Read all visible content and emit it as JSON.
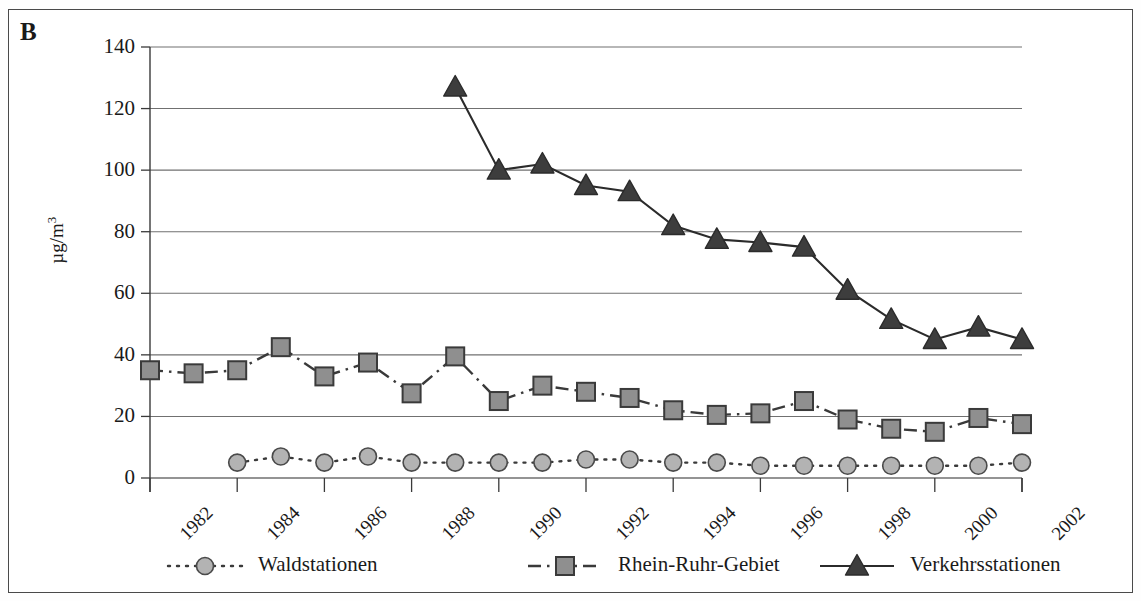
{
  "figure": {
    "panel_label": "B",
    "ylabel_main": "µg/m",
    "ylabel_exp": "3"
  },
  "legend": {
    "items": [
      {
        "label": "Waldstationen",
        "marker": "circle-marker",
        "line": "dotted",
        "fill": "#b3b3b3"
      },
      {
        "label": "Rhein-Ruhr-Gebiet",
        "marker": "square-marker",
        "line": "dash-dot",
        "fill": "#8f8f8f"
      },
      {
        "label": "Verkehrsstationen",
        "marker": "triangle-marker",
        "line": "solid",
        "fill": "#3d3d3d"
      }
    ]
  },
  "axes": {
    "y_ticks": [
      "0",
      "20",
      "40",
      "60",
      "80",
      "100",
      "120",
      "140"
    ],
    "x_ticks": [
      "1982",
      "1984",
      "1986",
      "1988",
      "1990",
      "1992",
      "1994",
      "1996",
      "1998",
      "2000",
      "2002"
    ]
  },
  "chart_data": {
    "type": "line",
    "title": "",
    "xlabel": "",
    "ylabel": "µg/m3",
    "xlim": [
      1982,
      2002
    ],
    "ylim": [
      0,
      140
    ],
    "ytick_interval": 20,
    "xtick_interval": 2,
    "grid": true,
    "legend_position": "bottom",
    "x": [
      1982,
      1983,
      1984,
      1985,
      1986,
      1987,
      1988,
      1989,
      1990,
      1991,
      1992,
      1993,
      1994,
      1995,
      1996,
      1997,
      1998,
      1999,
      2000,
      2001,
      2002
    ],
    "series": [
      {
        "name": "Waldstationen",
        "marker": "circle",
        "linestyle": "dotted",
        "color": "#b3b3b3",
        "x": [
          1984,
          1985,
          1986,
          1987,
          1988,
          1989,
          1990,
          1991,
          1992,
          1993,
          1994,
          1995,
          1996,
          1997,
          1998,
          1999,
          2000,
          2001,
          2002
        ],
        "values": [
          5,
          7,
          5,
          7,
          5,
          5,
          5,
          5,
          6,
          6,
          5,
          5,
          4,
          4,
          4,
          4,
          4,
          4,
          5
        ]
      },
      {
        "name": "Rhein-Ruhr-Gebiet",
        "marker": "square",
        "linestyle": "dash-dot",
        "color": "#8f8f8f",
        "x": [
          1982,
          1983,
          1984,
          1985,
          1986,
          1987,
          1988,
          1989,
          1990,
          1991,
          1992,
          1993,
          1994,
          1995,
          1996,
          1997,
          1998,
          1999,
          2000,
          2001,
          2002
        ],
        "values": [
          35,
          34,
          35,
          42.5,
          33,
          37.5,
          27.5,
          39.5,
          25,
          30,
          28,
          26,
          22,
          20.5,
          21,
          25,
          19,
          16,
          15,
          19.5,
          17.5
        ]
      },
      {
        "name": "Verkehrsstationen",
        "marker": "triangle",
        "linestyle": "solid",
        "color": "#3d3d3d",
        "x": [
          1989,
          1990,
          1991,
          1992,
          1993,
          1994,
          1995,
          1996,
          1997,
          1998,
          1999,
          2000,
          2001,
          2002
        ],
        "values": [
          127,
          100,
          102,
          95,
          93,
          82,
          77.5,
          76.5,
          75,
          61,
          51.5,
          45,
          49,
          45
        ]
      }
    ]
  }
}
